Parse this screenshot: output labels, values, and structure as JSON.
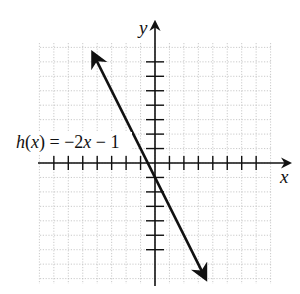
{
  "chart_data": {
    "type": "line",
    "title": "",
    "function_label": "h(x) = −2x − 1",
    "xlabel": "x",
    "ylabel": "y",
    "xlim": [
      -8,
      8
    ],
    "ylim": [
      -8.3,
      8.3
    ],
    "grid": true,
    "series": [
      {
        "name": "h(x) = −2x − 1",
        "slope": -2,
        "intercept": -1,
        "x": [
          -4.3,
          3.5
        ],
        "y": [
          7.6,
          -8.0
        ],
        "arrows": "both"
      }
    ],
    "x_ticks": [
      -7,
      -6,
      -5,
      -4,
      -3,
      -2,
      -1,
      1,
      2,
      3,
      4,
      5,
      6,
      7
    ],
    "y_ticks": [
      -6,
      -5,
      -4,
      -3,
      -2,
      -1,
      1,
      2,
      3,
      4,
      5,
      6,
      7
    ]
  }
}
